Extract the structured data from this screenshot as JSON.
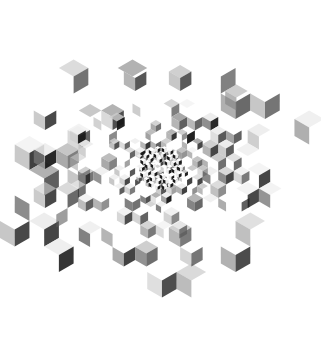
{
  "artwork": {
    "title": "Recursive Rhombille Tiling",
    "type": "generative-geometric-artwork",
    "canvas": {
      "width": 321,
      "height": 343,
      "background": "#ffffff"
    },
    "composition": {
      "overall_shape": "hexagon",
      "center_x": 161,
      "center_y": 168,
      "outer_radius": 152,
      "orientation_degrees": 0,
      "description": "Isometric rhombille (lozenge) tiling arranged in a hexagonal field; rhombi are smallest and densest at the center and become progressively larger and sparser toward the hexagon edges."
    },
    "tile": {
      "shape": "rhombus",
      "orientations_degrees": [
        0,
        60,
        120
      ],
      "face_count_per_cube": 3,
      "min_edge_px": 3,
      "max_edge_px": 17
    },
    "subdivision": {
      "scheme": "radial-recursive",
      "levels": 5,
      "level_edge_px": [
        17,
        13,
        9,
        6,
        3.5
      ],
      "level_radius_fraction": [
        1.0,
        0.78,
        0.56,
        0.34,
        0.16
      ],
      "fill_probability_by_level": [
        0.34,
        0.52,
        0.66,
        0.8,
        0.92
      ]
    },
    "palette": {
      "name": "grayscale",
      "background": "#ffffff",
      "swatches": [
        {
          "label": "near-black",
          "hex": "#1a1a1a"
        },
        {
          "label": "dark-gray",
          "hex": "#3d3d3d"
        },
        {
          "label": "mid-dark-gray",
          "hex": "#5c5c5c"
        },
        {
          "label": "mid-gray",
          "hex": "#808080"
        },
        {
          "label": "light-gray",
          "hex": "#a8a8a8"
        },
        {
          "label": "pale-gray",
          "hex": "#cccccc"
        },
        {
          "label": "near-white",
          "hex": "#ededed"
        },
        {
          "label": "white",
          "hex": "#ffffff"
        }
      ],
      "face_shading": {
        "top_face": "#ededed",
        "left_face": "#808080",
        "right_face": "#1a1a1a"
      }
    },
    "render": {
      "seed": 20240917,
      "stroke": "none",
      "antialias": true,
      "opacity_range": [
        0.55,
        1.0
      ]
    }
  }
}
